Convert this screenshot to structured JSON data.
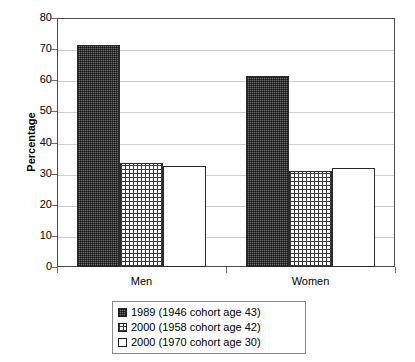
{
  "chart_data": {
    "type": "bar",
    "title": "",
    "xlabel": "",
    "ylabel": "Percentage",
    "ylim": [
      0,
      80
    ],
    "ytick_step": 10,
    "yticks": [
      80,
      70,
      60,
      50,
      40,
      30,
      20,
      10,
      0
    ],
    "grid": true,
    "legend_position": "bottom",
    "categories": [
      "Men",
      "Women"
    ],
    "series": [
      {
        "name": "1989 (1946 cohort age 43)",
        "pattern": "dark-checker",
        "values": [
          71.2,
          61.5
        ]
      },
      {
        "name": "2000 (1958 cohort age 42)",
        "pattern": "crosshatch-grid",
        "values": [
          33.3,
          31.0
        ]
      },
      {
        "name": "2000 (1970 cohort age 30)",
        "pattern": "white-solid",
        "values": [
          32.5,
          31.8
        ]
      }
    ]
  },
  "axis": {
    "y_title": "Percentage",
    "y_tick_labels": [
      "80",
      "70",
      "60",
      "50",
      "40",
      "30",
      "20",
      "10",
      "0"
    ],
    "x_tick_labels": [
      "Men",
      "Women"
    ]
  },
  "legend": {
    "items": [
      {
        "label": "1989 (1946 cohort age 43)",
        "swatch": "dark-checker-swatch"
      },
      {
        "label": "2000 (1958 cohort age 42)",
        "swatch": "crosshatch-grid-swatch"
      },
      {
        "label": "2000 (1970 cohort age 30)",
        "swatch": "white-solid-swatch"
      }
    ]
  },
  "colors": {
    "bar_outline": "#2b2b2b",
    "dark_fill": "#6e6e6e",
    "gridline": "#cfcfcf",
    "frame": "#4c4c4c",
    "white_fill": "#ffffff"
  }
}
